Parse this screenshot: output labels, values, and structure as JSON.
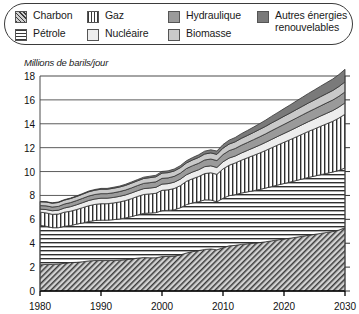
{
  "legend": {
    "items": [
      {
        "label": "Charbon",
        "swatch": "charbon-swatch",
        "pattern": "diagonal-hatch",
        "color": "#cfcfcf"
      },
      {
        "label": "Pétrole",
        "swatch": "petrole-swatch",
        "pattern": "horizontal-lines",
        "color": "#ffffff"
      },
      {
        "label": "Gaz",
        "swatch": "gaz-swatch",
        "pattern": "vertical-lines",
        "color": "#ffffff"
      },
      {
        "label": "Nucléaire",
        "swatch": "nucleaire-swatch",
        "pattern": "solid",
        "color": "#ededed"
      },
      {
        "label": "Hydraulique",
        "swatch": "hydraulique-swatch",
        "pattern": "solid",
        "color": "#9a9a9a"
      },
      {
        "label": "Biomasse",
        "swatch": "biomasse-swatch",
        "pattern": "solid",
        "color": "#c9c9c9"
      },
      {
        "label": "Autres énergies\nrenouvelables",
        "swatch": "autres-swatch",
        "pattern": "solid",
        "color": "#7a7a7a"
      }
    ]
  },
  "chart_data": {
    "type": "area",
    "title": "",
    "subtitle": "",
    "xlabel": "",
    "ylabel": "Millions de barils/jour",
    "xlim": [
      1980,
      2030
    ],
    "ylim": [
      0,
      18
    ],
    "yticks": [
      0,
      2,
      4,
      6,
      8,
      10,
      12,
      14,
      16,
      18
    ],
    "xticks": [
      1980,
      1990,
      2000,
      2010,
      2020,
      2030
    ],
    "grid": true,
    "legend_position": "top",
    "stacked": true,
    "x": [
      1980,
      1981,
      1982,
      1983,
      1984,
      1985,
      1986,
      1987,
      1988,
      1989,
      1990,
      1991,
      1992,
      1993,
      1994,
      1995,
      1996,
      1997,
      1998,
      1999,
      2000,
      2001,
      2002,
      2003,
      2004,
      2005,
      2006,
      2007,
      2008,
      2009,
      2010,
      2011,
      2012,
      2013,
      2014,
      2015,
      2016,
      2017,
      2018,
      2019,
      2020,
      2021,
      2022,
      2023,
      2024,
      2025,
      2026,
      2027,
      2028,
      2029,
      2030
    ],
    "series": [
      {
        "name": "Charbon",
        "values": [
          2.2,
          2.22,
          2.22,
          2.25,
          2.32,
          2.38,
          2.4,
          2.45,
          2.52,
          2.55,
          2.55,
          2.55,
          2.55,
          2.58,
          2.62,
          2.68,
          2.75,
          2.8,
          2.78,
          2.78,
          2.88,
          2.9,
          2.92,
          3.02,
          3.18,
          3.3,
          3.38,
          3.48,
          3.52,
          3.45,
          3.62,
          3.78,
          3.82,
          3.9,
          3.95,
          4.0,
          4.05,
          4.12,
          4.2,
          4.28,
          4.35,
          4.42,
          4.5,
          4.58,
          4.66,
          4.74,
          4.82,
          4.9,
          4.98,
          5.1,
          5.3
        ]
      },
      {
        "name": "Pétrole",
        "values": [
          3.3,
          3.2,
          3.08,
          3.05,
          3.1,
          3.1,
          3.2,
          3.25,
          3.3,
          3.35,
          3.38,
          3.38,
          3.42,
          3.45,
          3.5,
          3.55,
          3.62,
          3.7,
          3.75,
          3.78,
          3.85,
          3.85,
          3.88,
          3.95,
          4.05,
          4.08,
          4.1,
          4.15,
          4.1,
          4.02,
          4.15,
          4.2,
          4.25,
          4.3,
          4.35,
          4.4,
          4.45,
          4.5,
          4.55,
          4.6,
          4.65,
          4.7,
          4.75,
          4.8,
          4.85,
          4.88,
          4.92,
          4.95,
          4.98,
          5.0,
          5.0
        ]
      },
      {
        "name": "Gaz",
        "values": [
          1.1,
          1.12,
          1.12,
          1.14,
          1.18,
          1.2,
          1.22,
          1.28,
          1.32,
          1.35,
          1.38,
          1.38,
          1.4,
          1.42,
          1.45,
          1.5,
          1.55,
          1.58,
          1.6,
          1.62,
          1.7,
          1.72,
          1.78,
          1.85,
          1.95,
          2.02,
          2.1,
          2.2,
          2.28,
          2.3,
          2.45,
          2.55,
          2.65,
          2.75,
          2.85,
          2.95,
          3.05,
          3.15,
          3.25,
          3.35,
          3.45,
          3.55,
          3.65,
          3.75,
          3.85,
          3.95,
          4.05,
          4.15,
          4.25,
          4.38,
          4.5
        ]
      },
      {
        "name": "Nucléaire",
        "values": [
          0.25,
          0.28,
          0.3,
          0.32,
          0.35,
          0.38,
          0.4,
          0.42,
          0.44,
          0.45,
          0.46,
          0.46,
          0.46,
          0.47,
          0.47,
          0.48,
          0.48,
          0.49,
          0.49,
          0.5,
          0.52,
          0.52,
          0.53,
          0.54,
          0.55,
          0.56,
          0.57,
          0.58,
          0.58,
          0.57,
          0.6,
          0.6,
          0.58,
          0.6,
          0.62,
          0.64,
          0.66,
          0.68,
          0.7,
          0.72,
          0.74,
          0.76,
          0.78,
          0.8,
          0.82,
          0.84,
          0.86,
          0.88,
          0.9,
          0.92,
          0.95
        ]
      },
      {
        "name": "Hydraulique",
        "values": [
          0.3,
          0.31,
          0.31,
          0.32,
          0.33,
          0.34,
          0.35,
          0.36,
          0.37,
          0.38,
          0.38,
          0.38,
          0.39,
          0.4,
          0.41,
          0.42,
          0.43,
          0.44,
          0.45,
          0.46,
          0.48,
          0.48,
          0.49,
          0.5,
          0.52,
          0.53,
          0.54,
          0.56,
          0.57,
          0.58,
          0.6,
          0.62,
          0.63,
          0.65,
          0.66,
          0.68,
          0.7,
          0.71,
          0.73,
          0.74,
          0.76,
          0.78,
          0.79,
          0.81,
          0.82,
          0.84,
          0.85,
          0.87,
          0.88,
          0.9,
          0.92
        ]
      },
      {
        "name": "Biomasse",
        "values": [
          0.32,
          0.32,
          0.32,
          0.33,
          0.33,
          0.34,
          0.34,
          0.35,
          0.36,
          0.36,
          0.37,
          0.37,
          0.38,
          0.38,
          0.39,
          0.4,
          0.4,
          0.41,
          0.42,
          0.42,
          0.44,
          0.44,
          0.45,
          0.46,
          0.47,
          0.48,
          0.49,
          0.5,
          0.51,
          0.52,
          0.54,
          0.55,
          0.56,
          0.58,
          0.59,
          0.6,
          0.62,
          0.63,
          0.65,
          0.66,
          0.68,
          0.69,
          0.71,
          0.72,
          0.74,
          0.75,
          0.77,
          0.78,
          0.8,
          0.82,
          0.84
        ]
      },
      {
        "name": "Autres énergies renouvelables",
        "values": [
          0.03,
          0.03,
          0.03,
          0.04,
          0.04,
          0.04,
          0.05,
          0.05,
          0.06,
          0.06,
          0.07,
          0.07,
          0.08,
          0.08,
          0.09,
          0.1,
          0.1,
          0.11,
          0.12,
          0.13,
          0.14,
          0.15,
          0.16,
          0.17,
          0.18,
          0.2,
          0.22,
          0.24,
          0.26,
          0.28,
          0.3,
          0.33,
          0.36,
          0.39,
          0.42,
          0.45,
          0.48,
          0.52,
          0.56,
          0.6,
          0.64,
          0.68,
          0.72,
          0.76,
          0.8,
          0.84,
          0.88,
          0.92,
          0.96,
          1.0,
          1.05
        ]
      }
    ]
  }
}
